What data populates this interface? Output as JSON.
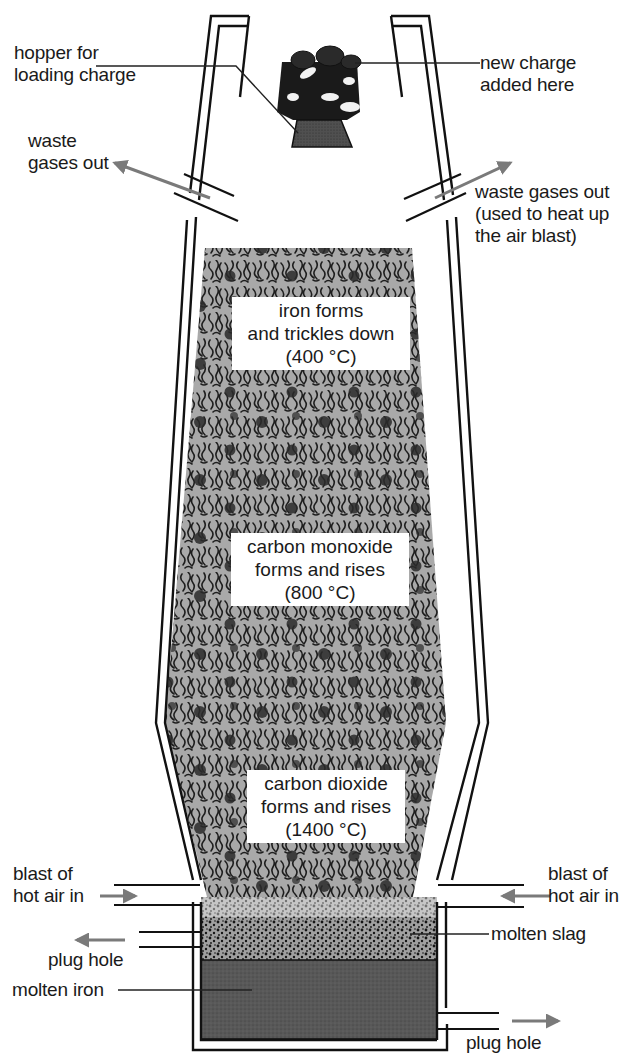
{
  "diagram": {
    "colors": {
      "wall": "#111111",
      "arrow": "#7a7a7a",
      "charge_fill": "#a9a9a9",
      "charge_pattern": "#1e1e1e",
      "slag_fill": "#9a9a9a",
      "iron_fill": "#555555",
      "hopper_fill": "#4a4a4a"
    },
    "labels": {
      "hopper": [
        "hopper for",
        "loading charge"
      ],
      "new_charge": [
        "new charge",
        "added here"
      ],
      "waste_left": [
        "waste",
        "gases out"
      ],
      "waste_right": [
        "waste gases out",
        "(used to heat up",
        "the air blast)"
      ],
      "blast_left": [
        "blast of",
        "hot air in"
      ],
      "blast_right": [
        "blast of",
        "hot air in"
      ],
      "plug_left": "plug hole",
      "plug_right": "plug hole",
      "molten_slag": "molten slag",
      "molten_iron": "molten iron"
    },
    "zones": [
      {
        "lines": [
          "iron forms",
          "and trickles down",
          "(400 °C)"
        ],
        "temperature_c": 400
      },
      {
        "lines": [
          "carbon monoxide",
          "forms and rises",
          "(800 °C)"
        ],
        "temperature_c": 800
      },
      {
        "lines": [
          "carbon dioxide",
          "forms and rises",
          "(1400 °C)"
        ],
        "temperature_c": 1400
      }
    ]
  }
}
